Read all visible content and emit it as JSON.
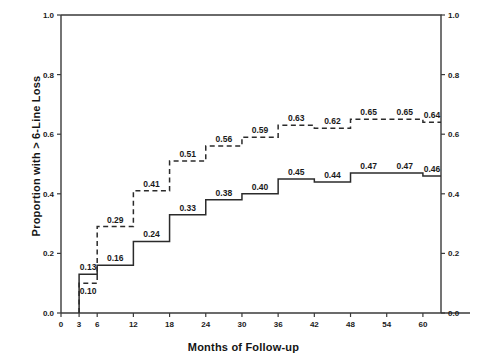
{
  "chart_data": {
    "type": "line",
    "title": "",
    "xlabel": "Months of Follow-up",
    "ylabel": "Proportion with > 6-Line Loss",
    "xlim": [
      0,
      63
    ],
    "ylim": [
      0.0,
      1.0
    ],
    "grid": false,
    "legend_position": "none",
    "xticks": [
      0,
      3,
      6,
      12,
      18,
      24,
      30,
      36,
      42,
      48,
      54,
      60
    ],
    "xticklabels": [
      "0",
      "3",
      "6",
      "12",
      "18",
      "24",
      "30",
      "36",
      "42",
      "48",
      "54",
      "60"
    ],
    "yticks": [
      0.0,
      0.2,
      0.4,
      0.6,
      0.8,
      1.0
    ],
    "yticklabels": [
      "0.0",
      "0.2",
      "0.4",
      "0.6",
      "0.8",
      "1.0"
    ],
    "right_axis": {
      "yticks": [
        0.0,
        0.2,
        0.4,
        0.6,
        0.8,
        1.0
      ],
      "yticklabels": [
        "0.0",
        "0.2",
        "0.4",
        "0.6",
        "0.8",
        "1.0"
      ]
    },
    "series": [
      {
        "name": "solid-curve",
        "style": "solid",
        "x": [
          3,
          6,
          12,
          18,
          24,
          30,
          36,
          42,
          48,
          54,
          60
        ],
        "values": [
          0.13,
          0.16,
          0.24,
          0.33,
          0.38,
          0.4,
          0.45,
          0.44,
          0.47,
          0.47,
          0.46
        ],
        "labels": [
          "0.13",
          "0.16",
          "0.24",
          "0.33",
          "0.38",
          "0.40",
          "0.45",
          "0.44",
          "0.47",
          "0.47",
          "0.46"
        ]
      },
      {
        "name": "dashed-curve",
        "style": "dashed",
        "x": [
          3,
          6,
          12,
          18,
          24,
          30,
          36,
          42,
          48,
          54,
          60
        ],
        "values": [
          0.1,
          0.29,
          0.41,
          0.51,
          0.56,
          0.59,
          0.63,
          0.62,
          0.65,
          0.65,
          0.64
        ],
        "labels": [
          "0.10",
          "0.29",
          "0.41",
          "0.51",
          "0.56",
          "0.59",
          "0.63",
          "0.62",
          "0.65",
          "0.65",
          "0.64"
        ]
      }
    ]
  }
}
